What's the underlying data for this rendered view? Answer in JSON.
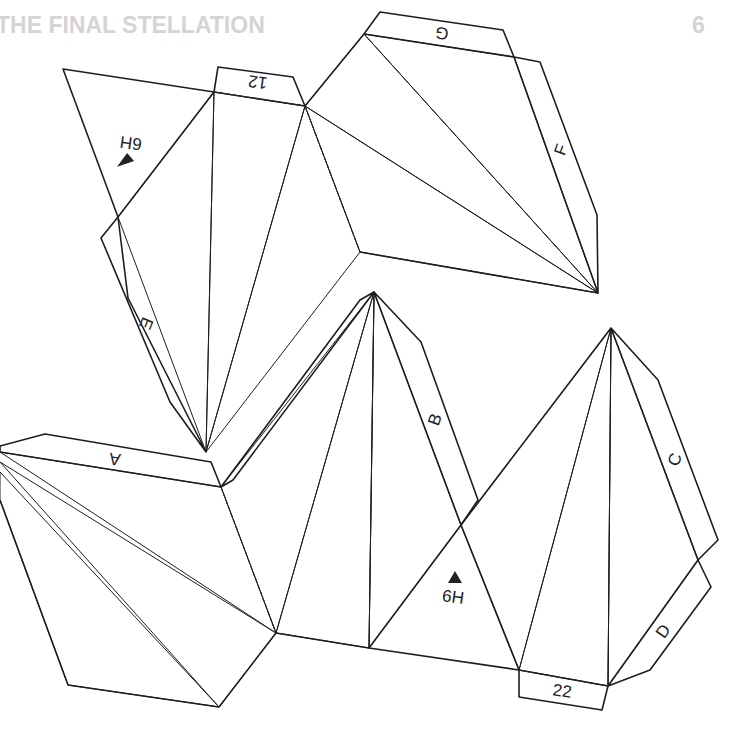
{
  "page": {
    "header_title": "THE FINAL STELLATION",
    "page_number": "6"
  },
  "colors": {
    "header_text": "#d4d4d4",
    "shade_lightest": "#e3e3e3",
    "shade_light": "#cccccc",
    "shade_mid_light": "#a9a9a9",
    "shade_mid": "#8c8c8c",
    "shade_dark": "#6f6f6f",
    "shade_darkest": "#3a3a3a",
    "outline": "#1e1e1e"
  },
  "net": {
    "glue_tabs": [
      {
        "id": "tab-12",
        "label": "12",
        "orientation": "upside-down"
      },
      {
        "id": "tab-g",
        "label": "G",
        "orientation": "upside-down"
      },
      {
        "id": "tab-f",
        "label": "F",
        "orientation": "rotated"
      },
      {
        "id": "tab-e",
        "label": "E",
        "orientation": "rotated"
      },
      {
        "id": "tab-a",
        "label": "A",
        "orientation": "upside-down"
      },
      {
        "id": "tab-b",
        "label": "B",
        "orientation": "rotated"
      },
      {
        "id": "tab-c",
        "label": "C",
        "orientation": "rotated"
      },
      {
        "id": "tab-d",
        "label": "D",
        "orientation": "rotated"
      },
      {
        "id": "tab-22",
        "label": "22",
        "orientation": "upright"
      }
    ],
    "attach_markers": [
      {
        "id": "marker-top",
        "label": "6H",
        "orientation": "upside-down",
        "icon": "triangle-marker"
      },
      {
        "id": "marker-bottom",
        "label": "6H",
        "orientation": "upright",
        "icon": "triangle-marker"
      }
    ]
  }
}
